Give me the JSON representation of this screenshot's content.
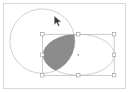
{
  "app": {
    "title": "vector-canvas",
    "canvas_background": "#ffffff",
    "frame_border_color": "#d8d8d8"
  },
  "chart_data": {
    "type": "diagram",
    "title": "",
    "subtitle": "",
    "xlabel": "",
    "ylabel": "",
    "viewbox": [
      0,
      0,
      123,
      86
    ],
    "shapes": [
      {
        "name": "large-circle",
        "kind": "circle",
        "cx": 39,
        "cy": 38,
        "r": 33,
        "stroke": "#c9c9c9",
        "stroke_width": 0.9,
        "fill": "none"
      },
      {
        "name": "right-ellipse",
        "kind": "ellipse",
        "cx": 76,
        "cy": 52,
        "rx": 36,
        "ry": 21,
        "stroke": "#c9c9c9",
        "stroke_width": 0.9,
        "fill": "none"
      }
    ],
    "intersection": {
      "name": "intersection-region",
      "fill": "#8c8c8c",
      "stroke": "#7a7a7a",
      "stroke_width": 0.6
    },
    "legend": [],
    "grid": false
  },
  "selection": {
    "label": "selection-bounding-box",
    "x": 39,
    "y": 31,
    "width": 73,
    "height": 42,
    "stroke_color": "#b5b5b5",
    "stroke_width": 0.7,
    "handle_fill": "#ffffff",
    "handle_stroke": "#9a9a9a",
    "handle_size": 3.4,
    "handles": [
      {
        "name": "handle-top-left",
        "x": 39,
        "y": 31
      },
      {
        "name": "handle-top-center",
        "x": 75.5,
        "y": 31
      },
      {
        "name": "handle-top-right",
        "x": 112,
        "y": 31
      },
      {
        "name": "handle-middle-left",
        "x": 39,
        "y": 52
      },
      {
        "name": "handle-middle-right",
        "x": 112,
        "y": 52
      },
      {
        "name": "handle-bottom-left",
        "x": 39,
        "y": 73
      },
      {
        "name": "handle-bottom-center",
        "x": 75.5,
        "y": 73
      },
      {
        "name": "handle-bottom-right",
        "x": 112,
        "y": 73
      }
    ],
    "center_marker": {
      "name": "selection-center-marker",
      "x": 75.5,
      "y": 52,
      "r": 0.9,
      "fill": "#9a9a9a"
    }
  },
  "cursor": {
    "name": "mouse-pointer",
    "x": 54,
    "y": 16,
    "fill": "#3a3a3a",
    "stroke": "#ffffff"
  }
}
